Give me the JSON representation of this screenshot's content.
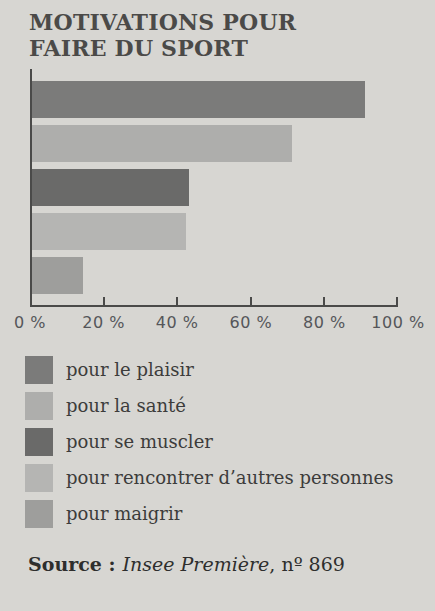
{
  "title": {
    "line1": "MOTIVATIONS POUR",
    "line2": "FAIRE DU SPORT"
  },
  "chart_data": {
    "type": "bar",
    "orientation": "horizontal",
    "title": "Motivations pour faire du sport",
    "categories": [
      "pour le plaisir",
      "pour la santé",
      "pour se muscler",
      "pour rencontrer d’autres personnes",
      "pour maigrir"
    ],
    "values": [
      91,
      71,
      43,
      42,
      14
    ],
    "unit": "%",
    "xlim": [
      0,
      100
    ],
    "x_ticks": [
      "0 %",
      "20 %",
      "40 %",
      "60 %",
      "80 %",
      "100 %"
    ],
    "bar_colors": [
      "#7b7b7a",
      "#aeaeac",
      "#6a6a69",
      "#b5b5b3",
      "#9e9e9c"
    ],
    "grid": false,
    "legend_position": "below-chart"
  },
  "source": {
    "label": "Source :",
    "work": "Insee Première",
    "suffix": ", nº 869"
  },
  "colors": {
    "background": "#d7d6d2",
    "title_text": "#4b4a48",
    "body_text": "#3c3c3b",
    "axis": "#4a4a49",
    "axis_labels": "#55565a"
  }
}
